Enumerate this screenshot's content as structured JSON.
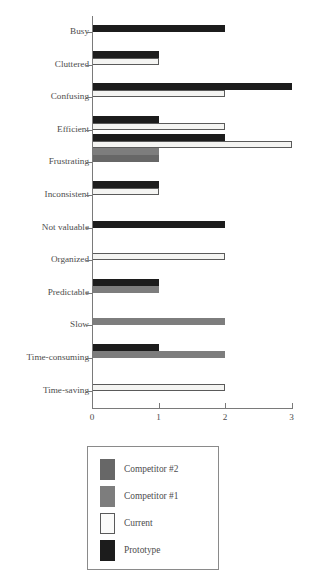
{
  "chart_data": {
    "type": "bar",
    "orientation": "horizontal",
    "title": "",
    "xlabel": "",
    "ylabel": "",
    "xlim": [
      0,
      3
    ],
    "xticks": [
      0,
      1,
      2,
      3
    ],
    "xtick_labels": [
      "0",
      "1",
      "2",
      "3"
    ],
    "grid": false,
    "legend_position": "bottom",
    "categories": [
      "Busy",
      "Cluttered",
      "Confusing",
      "Efficient",
      "Frustrating",
      "Inconsistent",
      "Not valuable",
      "Organized",
      "Predictable",
      "Slow",
      "Time-consuming",
      "Time-saving"
    ],
    "series": [
      {
        "name": "Prototype",
        "color": "#1c1c1c",
        "values": [
          2,
          1,
          3,
          1,
          2,
          1,
          2,
          0,
          1,
          0,
          1,
          0
        ]
      },
      {
        "name": "Current",
        "color": "#f4f4f2",
        "values": [
          0,
          1,
          2,
          2,
          3,
          1,
          0,
          2,
          0,
          0,
          0,
          2
        ]
      },
      {
        "name": "Competitor #1",
        "color": "#7d7d7d",
        "values": [
          0,
          0,
          0,
          0,
          1,
          0,
          0,
          0,
          1,
          2,
          2,
          0
        ]
      },
      {
        "name": "Competitor #2",
        "color": "#676767",
        "values": [
          0,
          0,
          0,
          0,
          1,
          0,
          0,
          0,
          0,
          0,
          0,
          0
        ]
      }
    ],
    "legend_entries": [
      {
        "label": "Competitor #2",
        "color": "#676767"
      },
      {
        "label": "Competitor #1",
        "color": "#7d7d7d"
      },
      {
        "label": "Current",
        "color": "#f4f4f2"
      },
      {
        "label": "Prototype",
        "color": "#1c1c1c"
      }
    ]
  }
}
